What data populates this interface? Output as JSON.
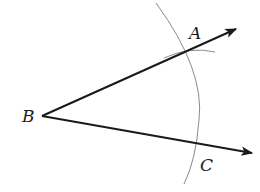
{
  "diagram": {
    "points": {
      "B": {
        "label": "B",
        "x": 42,
        "y": 116
      },
      "A": {
        "label": "A",
        "x": 188,
        "y": 50
      },
      "C": {
        "label": "C",
        "x": 199,
        "y": 143
      }
    },
    "rays": [
      {
        "from": "B",
        "through": "A",
        "tip": [
          236,
          29
        ]
      },
      {
        "from": "B",
        "through": "C",
        "tip": [
          252,
          153
        ]
      }
    ],
    "arcs": [
      {
        "name": "main-arc",
        "center": "B",
        "color": "#808080"
      },
      {
        "name": "small-arc-at-A",
        "color": "#808080"
      }
    ],
    "colors": {
      "ray": "#1a1a1a",
      "arc": "#8a8a8a"
    }
  }
}
